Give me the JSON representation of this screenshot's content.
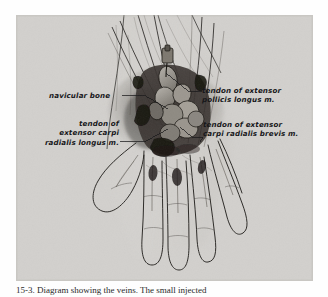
{
  "figure": {
    "kind": "anatomical-photograph-plate",
    "plate_background_color": "#d6d5d2",
    "page_background_color": "#fefefe",
    "label_color": "#17171a",
    "leader_line_color": "#1a1a1a"
  },
  "labels": {
    "navicular": {
      "name": "navicular-bone",
      "lines": [
        "navicular bone"
      ],
      "text": "navicular bone"
    },
    "extensor_pollicis_longus": {
      "name": "tendon-of-extensor-pollicis-longus",
      "line1": "tendon of extensor",
      "line2": "pollicis longus m."
    },
    "extensor_carpi_radialis_longus": {
      "name": "tendon-of-extensor-carpi-radialis-longus",
      "line1": "tendon of",
      "line2": "extensor carpi",
      "line3": "radialis longus m."
    },
    "extensor_carpi_radialis_brevis": {
      "name": "tendon-of-extensor-carpi-radialis-brevis",
      "line1": "tendon of extensor",
      "line2": "carpi radialis brevis m."
    }
  },
  "caption": {
    "text": "15-3. Diagram showing the veins. The small injected"
  }
}
